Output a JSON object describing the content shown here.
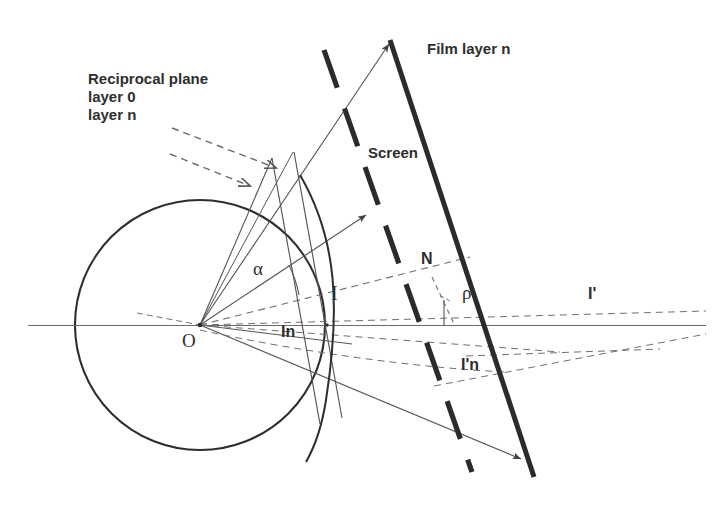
{
  "figure": {
    "background_color": "#ffffff",
    "ink_color": "#2e2e2e",
    "thin_line_color": "#555555",
    "width": 720,
    "height": 505
  },
  "labels": {
    "reciprocal_plane": "Reciprocal plane",
    "layer_0": "layer 0",
    "layer_n": "layer n",
    "film_layer_n": "Film layer n",
    "screen": "Screen",
    "alpha": "α",
    "rho": "ρ",
    "normal_N": "N",
    "point_I": "I",
    "point_In": "In",
    "point_I_prime": "I'",
    "point_I_prime_n": "I'n",
    "origin_O": "O"
  },
  "annotations": [
    {
      "name": "reciprocal-plane-caption",
      "text": "Reciprocal plane",
      "x": 88,
      "y": 78,
      "size": 15,
      "bold": true
    },
    {
      "name": "layer-0-caption",
      "text": "layer 0",
      "x": 88,
      "y": 96,
      "size": 15,
      "bold": true
    },
    {
      "name": "layer-n-caption",
      "text": "layer n",
      "x": 88,
      "y": 114,
      "size": 15,
      "bold": true
    },
    {
      "name": "film-layer-n-caption",
      "text": "Film layer n",
      "x": 427,
      "y": 48,
      "size": 15,
      "bold": true
    },
    {
      "name": "screen-caption",
      "text": "Screen",
      "x": 368,
      "y": 152,
      "size": 15,
      "bold": true
    },
    {
      "name": "alpha-angle-label",
      "text": "α",
      "x": 253,
      "y": 268,
      "size": 17,
      "bold": false
    },
    {
      "name": "rho-angle-label",
      "text": "ρ",
      "x": 462,
      "y": 292,
      "size": 17,
      "bold": false
    },
    {
      "name": "normal-n-label",
      "text": "N",
      "x": 421,
      "y": 258,
      "size": 16,
      "bold": true
    },
    {
      "name": "intersection-i-label",
      "text": "I",
      "x": 331,
      "y": 291,
      "size": 18,
      "bold": false
    },
    {
      "name": "intersection-in-label",
      "text": "In",
      "x": 281,
      "y": 331,
      "size": 16,
      "bold": true
    },
    {
      "name": "intersection-i-prime-label",
      "text": "I'",
      "x": 588,
      "y": 292,
      "size": 16,
      "bold": true
    },
    {
      "name": "intersection-i-prime-n-label",
      "text": "I'n",
      "x": 461,
      "y": 364,
      "size": 16,
      "bold": true
    },
    {
      "name": "origin-o-label",
      "text": "O",
      "x": 182,
      "y": 339,
      "size": 17,
      "bold": false
    }
  ],
  "geometry": {
    "origin": {
      "x": 200,
      "y": 325
    },
    "ewald_circle": {
      "cx": 200,
      "cy": 325,
      "r": 125
    },
    "horizontal_axis": {
      "x1": 28,
      "y1": 325,
      "x2": 706,
      "y2": 325
    },
    "film_line": {
      "x1": 390,
      "y1": 38,
      "x2": 534,
      "y2": 477,
      "thickness": 5,
      "style": "solid"
    },
    "screen_line": {
      "x1": 324,
      "y1": 50,
      "x2": 470,
      "y2": 470,
      "thickness": 5,
      "style": "dashed"
    },
    "reciprocal_plane_layer0": {
      "x1": 275,
      "y1": 160,
      "x2": 322,
      "y2": 420
    },
    "reciprocal_plane_layern": {
      "x1": 295,
      "y1": 155,
      "x2": 343,
      "y2": 415
    }
  }
}
